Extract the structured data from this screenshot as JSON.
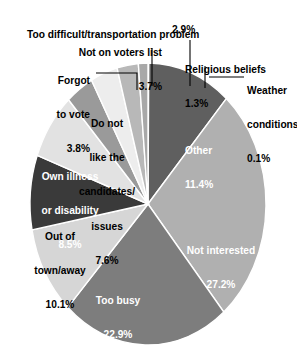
{
  "chart_data": {
    "type": "pie",
    "title": "",
    "subtitle": "",
    "xlabel": "",
    "ylabel": "",
    "legend_position": "none",
    "grid": false,
    "value_unit": "percent",
    "start_angle_deg": 0,
    "direction": "clockwise",
    "categories": [
      "Weather conditions",
      "Other",
      "Not interested",
      "Too busy",
      "Out of town/away",
      "Own illness or disability",
      "Do not like the candidates/issues",
      "Forgot to vote",
      "Not on voters list",
      "Too difficult/transportation problem",
      "Religious beliefs"
    ],
    "values": [
      0.1,
      11.4,
      27.2,
      22.9,
      10.1,
      8.5,
      7.6,
      3.8,
      3.7,
      2.9,
      1.3
    ],
    "value_labels": [
      "0.1%",
      "11.4%",
      "27.2%",
      "22.9%",
      "10.1%",
      "8.5%",
      "7.6%",
      "3.8%",
      "3.7%",
      "2.9%",
      "1.3%"
    ],
    "colors": [
      "#c9c9c9",
      "#5f5f5f",
      "#b0b0b0",
      "#7d7d7d",
      "#d6d6d6",
      "#3a3a3a",
      "#e2e2e2",
      "#9a9a9a",
      "#ededed",
      "#b8b8b8",
      "#a8a8a8"
    ],
    "slices": [
      {
        "label": "Weather conditions",
        "value": 0.1,
        "value_label": "0.1%",
        "color": "#c9c9c9",
        "label_placement": "outside-right"
      },
      {
        "label": "Other",
        "value": 11.4,
        "value_label": "11.4%",
        "color": "#5f5f5f",
        "label_placement": "inside"
      },
      {
        "label": "Not interested",
        "value": 27.2,
        "value_label": "27.2%",
        "color": "#b0b0b0",
        "label_placement": "inside"
      },
      {
        "label": "Too busy",
        "value": 22.9,
        "value_label": "22.9%",
        "color": "#7d7d7d",
        "label_placement": "inside"
      },
      {
        "label": "Out of town/away",
        "value": 10.1,
        "value_label": "10.1%",
        "color": "#d6d6d6",
        "label_placement": "inside"
      },
      {
        "label": "Own illness or disability",
        "value": 8.5,
        "value_label": "8.5%",
        "color": "#3a3a3a",
        "label_placement": "inside"
      },
      {
        "label": "Do not like the candidates/issues",
        "value": 7.6,
        "value_label": "7.6%",
        "color": "#e2e2e2",
        "label_placement": "inside"
      },
      {
        "label": "Forgot to vote",
        "value": 3.8,
        "value_label": "3.8%",
        "color": "#9a9a9a",
        "label_placement": "outside-left"
      },
      {
        "label": "Not on voters list",
        "value": 3.7,
        "value_label": "3.7%",
        "color": "#ededed",
        "label_placement": "outside-top"
      },
      {
        "label": "Too difficult/transportation problem",
        "value": 2.9,
        "value_label": "2.9%",
        "color": "#b8b8b8",
        "label_placement": "outside-top"
      },
      {
        "label": "Religious beliefs",
        "value": 1.3,
        "value_label": "1.3%",
        "color": "#a8a8a8",
        "label_placement": "outside-top-right"
      }
    ]
  },
  "labels": {
    "too_difficult": {
      "line1": "Too difficult/transportation problem",
      "line2": "2.9%"
    },
    "not_on_voters_list": {
      "line1": "Not on voters list",
      "line2": "3.7%"
    },
    "religious_beliefs": {
      "line1": "Religious beliefs",
      "line2": "1.3%"
    },
    "weather_conditions": {
      "line1": "Weather",
      "line2": "conditions",
      "line3": "0.1%"
    },
    "forgot_to_vote": {
      "line1": "Forgot",
      "line2": "to vote",
      "line3": "3.8%"
    },
    "do_not_like": {
      "line1": "Do not",
      "line2": "like the",
      "line3": "candidates/",
      "line4": "issues",
      "line5": "7.6%"
    },
    "own_illness": {
      "line1": "Own illness",
      "line2": "or disability",
      "line3": "8.5%"
    },
    "out_of_town": {
      "line1": "Out of",
      "line2": "town/away",
      "line3": "10.1%"
    },
    "too_busy": {
      "line1": "Too busy",
      "line2": "22.9%"
    },
    "not_interested": {
      "line1": "Not interested",
      "line2": "27.2%"
    },
    "other": {
      "line1": "Other",
      "line2": "11.4%"
    }
  }
}
